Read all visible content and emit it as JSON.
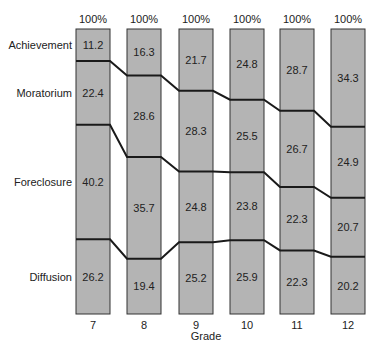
{
  "chart_data": {
    "type": "bar",
    "subtype": "stacked-100-percent",
    "title": "",
    "xlabel": "Grade",
    "ylabel": "",
    "categories": [
      "7",
      "8",
      "9",
      "10",
      "11",
      "12"
    ],
    "top_labels": [
      "100%",
      "100%",
      "100%",
      "100%",
      "100%",
      "100%"
    ],
    "series": [
      {
        "name": "Achievement",
        "values": [
          11.2,
          16.3,
          21.7,
          24.8,
          28.7,
          34.3
        ]
      },
      {
        "name": "Moratorium",
        "values": [
          22.4,
          28.6,
          28.3,
          25.5,
          26.7,
          24.9
        ]
      },
      {
        "name": "Foreclosure",
        "values": [
          40.2,
          35.7,
          24.8,
          23.8,
          22.3,
          20.7
        ]
      },
      {
        "name": "Diffusion",
        "values": [
          26.2,
          19.4,
          25.2,
          25.9,
          22.3,
          20.2
        ]
      }
    ],
    "ylim": [
      0,
      100
    ],
    "grid": false,
    "legend": "series names as row labels on left",
    "colors": {
      "bar_fill": "#b4b4b4",
      "bar_stroke": "#333333",
      "connector": "#1a1a1a"
    }
  },
  "row_labels": [
    "Achievement",
    "Moratorium",
    "Foreclosure",
    "Diffusion"
  ],
  "axis": {
    "xlabel": "Grade"
  }
}
